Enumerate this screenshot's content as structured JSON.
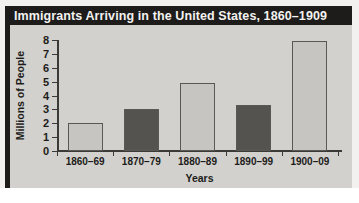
{
  "figure": {
    "title": "Immigrants Arriving in the United States, 1860–1909",
    "background_color": "#d2d1cd",
    "title_bar_color": "#1d1c1a",
    "title_text_color": "#f3f2f0"
  },
  "chart_data": {
    "type": "bar",
    "title": "Immigrants Arriving in the United States, 1860–1909",
    "xlabel": "Years",
    "ylabel": "Millions of People",
    "categories": [
      "1860–69",
      "1870–79",
      "1880–89",
      "1890–99",
      "1900–09"
    ],
    "values": [
      2.0,
      3.0,
      4.9,
      3.3,
      7.9
    ],
    "bar_colors": [
      "#c6c5c1",
      "#545350",
      "#c6c5c1",
      "#545350",
      "#c6c5c1"
    ],
    "ylim": [
      0,
      8
    ],
    "yticks": [
      0,
      1,
      2,
      3,
      4,
      5,
      6,
      7,
      8
    ],
    "ytick_labels": [
      "0",
      "1",
      "2",
      "3",
      "4",
      "5",
      "6",
      "7",
      "8"
    ],
    "grid": false,
    "legend": null,
    "axis_color": "#3b3a38",
    "bar_edge_color": "#595856"
  }
}
